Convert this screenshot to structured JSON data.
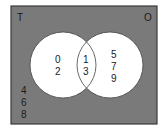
{
  "diagram": {
    "type": "venn",
    "universe": {
      "label": "",
      "fill": "#7a7a7a",
      "border": "#3a3a3a"
    },
    "sets": [
      {
        "label": "T",
        "fill": "#ffffff"
      },
      {
        "label": "O",
        "fill": "#ffffff"
      }
    ],
    "regions": {
      "only_left": [
        "0",
        "2"
      ],
      "intersection": [
        "1",
        "3"
      ],
      "only_right": [
        "5",
        "7",
        "9"
      ],
      "outside": [
        "4",
        "6",
        "8"
      ]
    }
  }
}
